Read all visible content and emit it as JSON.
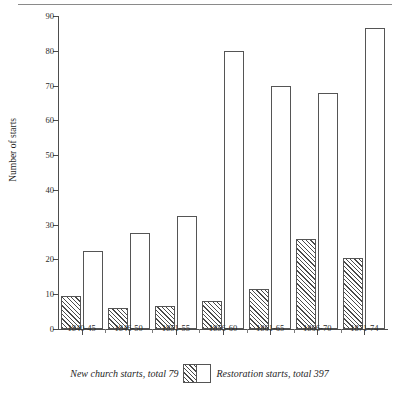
{
  "chart_data": {
    "type": "bar",
    "title": "",
    "xlabel": "",
    "ylabel": "Number of starts",
    "ylim": [
      0,
      90
    ],
    "yticks": [
      0,
      10,
      20,
      30,
      40,
      50,
      60,
      70,
      80,
      90
    ],
    "grid": false,
    "legend_position": "bottom-center",
    "categories": [
      "1840-45",
      "1846-50",
      "1851-55",
      "1856-60",
      "1861-65",
      "1866-70",
      "1871-74"
    ],
    "series": [
      {
        "name": "New church starts, total 79",
        "key": "new-church",
        "fill": "diagonal-hatch",
        "values": [
          9.5,
          6,
          6.5,
          8,
          11.5,
          26,
          20.5
        ]
      },
      {
        "name": "Restoration starts, total 397",
        "key": "restoration",
        "fill": "white",
        "values": [
          22.5,
          27.5,
          32.5,
          80,
          70,
          68,
          86.5
        ]
      }
    ]
  },
  "axis": {
    "y_title": "Number of starts",
    "y_ticks": [
      "0",
      "10",
      "20",
      "30",
      "40",
      "50",
      "60",
      "70",
      "80",
      "90"
    ],
    "x_ticks": [
      "1840-45",
      "1846-50",
      "1851-55",
      "1856-60",
      "1861-65",
      "1866-70",
      "1871-74"
    ]
  },
  "legend": {
    "left_label": "New church starts, total 79",
    "right_label": "Restoration starts, total 397"
  },
  "colors": {
    "axis": "#4d4d4d",
    "bar_outline": "#555555",
    "hatch": "#4a4a4a",
    "bar_fill": "#ffffff",
    "rule": "#8a8a8a",
    "text": "#1f1f1f"
  }
}
